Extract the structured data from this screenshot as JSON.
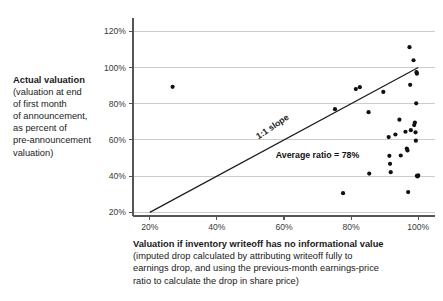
{
  "y_axis_caption": {
    "title": "Actual valuation",
    "subtitle_lines": [
      "(valuation at end",
      "of first month",
      "of announcement,",
      "as percent of",
      "pre-announcement",
      "valuation)"
    ]
  },
  "x_axis_caption": {
    "title": "Valuation if inventory writeoff has no informational value",
    "subtitle_lines": [
      "(imputed drop calculated by attributing writeoff fully to",
      "earnings drop, and using the previous-month earnings-price",
      "ratio to calculate the drop in share price)"
    ]
  },
  "colors": {
    "point": "#111111",
    "line": "#1a1a1a",
    "grid": "#cccccc",
    "axis": "#555555",
    "text": "#1a1a1a",
    "background": "#ffffff"
  },
  "chart_data": {
    "type": "scatter",
    "title": "",
    "xlabel": "Valuation if inventory writeoff has no informational value",
    "ylabel": "Actual valuation",
    "xlim": [
      15,
      105
    ],
    "ylim": [
      18,
      124
    ],
    "xticks": [
      20,
      40,
      60,
      80,
      100
    ],
    "xtick_labels": [
      "20%",
      "40%",
      "60%",
      "80%",
      "100%"
    ],
    "yticks": [
      20,
      40,
      60,
      80,
      100,
      120
    ],
    "ytick_labels": [
      "20%",
      "40%",
      "60%",
      "80%",
      "100%",
      "120%"
    ],
    "grid": "horizontal",
    "legend": "none",
    "reference_line": {
      "label": "1:1 slope",
      "from": [
        20,
        20
      ],
      "to": [
        100,
        100
      ],
      "slope": 1
    },
    "annotations": [
      {
        "name": "slope-label",
        "text": "1:1 slope",
        "x": 57,
        "y": 66,
        "rotation": -34
      },
      {
        "name": "average-ratio-label",
        "text": "Average ratio = 78%",
        "x": 70,
        "y": 50
      }
    ],
    "points": [
      {
        "x": 26.8,
        "y": 89.3
      },
      {
        "x": 75.2,
        "y": 77.0
      },
      {
        "x": 77.6,
        "y": 30.6
      },
      {
        "x": 81.4,
        "y": 88.1
      },
      {
        "x": 82.6,
        "y": 89.1
      },
      {
        "x": 85.2,
        "y": 75.3
      },
      {
        "x": 85.4,
        "y": 41.4
      },
      {
        "x": 89.6,
        "y": 86.5
      },
      {
        "x": 91.2,
        "y": 61.6
      },
      {
        "x": 91.4,
        "y": 51.2
      },
      {
        "x": 91.6,
        "y": 46.8
      },
      {
        "x": 91.8,
        "y": 42.2
      },
      {
        "x": 93.2,
        "y": 63.0
      },
      {
        "x": 94.4,
        "y": 71.2
      },
      {
        "x": 94.8,
        "y": 51.4
      },
      {
        "x": 96.2,
        "y": 64.5
      },
      {
        "x": 96.6,
        "y": 55.2
      },
      {
        "x": 96.8,
        "y": 54.2
      },
      {
        "x": 97.0,
        "y": 31.2
      },
      {
        "x": 97.4,
        "y": 111.2
      },
      {
        "x": 97.6,
        "y": 90.4
      },
      {
        "x": 97.8,
        "y": 65.4
      },
      {
        "x": 98.6,
        "y": 104.0
      },
      {
        "x": 98.8,
        "y": 68.2
      },
      {
        "x": 99.0,
        "y": 69.6
      },
      {
        "x": 99.2,
        "y": 64.2
      },
      {
        "x": 99.3,
        "y": 59.6
      },
      {
        "x": 99.4,
        "y": 80.2
      },
      {
        "x": 99.5,
        "y": 97.4
      },
      {
        "x": 99.6,
        "y": 96.6
      },
      {
        "x": 99.6,
        "y": 40.2
      },
      {
        "x": 99.8,
        "y": 39.8
      },
      {
        "x": 100.0,
        "y": 40.4
      }
    ]
  }
}
